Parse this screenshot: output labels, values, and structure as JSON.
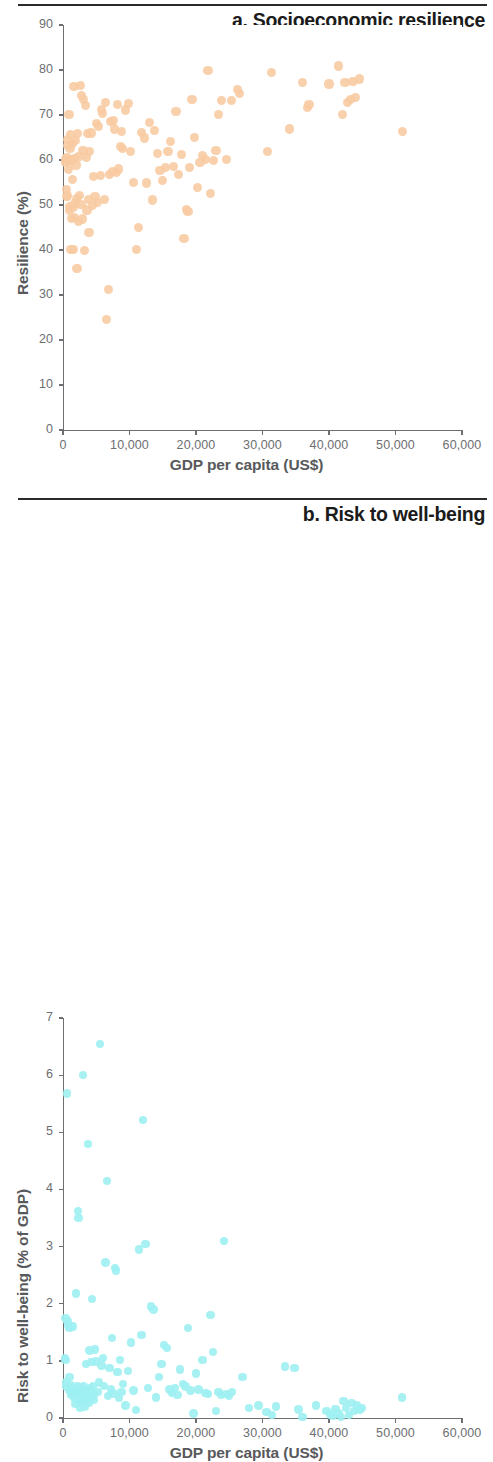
{
  "figure": {
    "panels": [
      {
        "id": "a",
        "title": "a. Socioeconomic resilience",
        "xlabel": "GDP per capita (US$)",
        "ylabel": "Resilience (%)",
        "point_color": "#f8c9a1",
        "xticks": [
          "0",
          "10,000",
          "20,000",
          "30,000",
          "40,000",
          "50,000",
          "60,000"
        ],
        "yticks": [
          "0",
          "10",
          "20",
          "30",
          "40",
          "50",
          "60",
          "70",
          "80",
          "90"
        ]
      },
      {
        "id": "b",
        "title": "b. Risk to well-being",
        "xlabel": "GDP per capita (US$)",
        "ylabel": "Risk to well-being (% of GDP)",
        "point_color": "#9df0f2",
        "xticks": [
          "0",
          "10,000",
          "20,000",
          "30,000",
          "40,000",
          "50,000",
          "60,000"
        ],
        "yticks": [
          "0",
          "1",
          "2",
          "3",
          "4",
          "5",
          "6",
          "7"
        ]
      }
    ]
  },
  "chart_data": [
    {
      "type": "scatter",
      "title": "a. Socioeconomic resilience",
      "xlabel": "GDP per capita (US$)",
      "ylabel": "Resilience (%)",
      "xlim": [
        0,
        60000
      ],
      "ylim": [
        0,
        90
      ],
      "xticks": [
        0,
        10000,
        20000,
        30000,
        40000,
        50000,
        60000
      ],
      "yticks": [
        0,
        10,
        20,
        30,
        40,
        50,
        60,
        70,
        80,
        90
      ],
      "grid": false,
      "legend": "none",
      "marker_color": "#f8c9a1",
      "points": [
        [
          400,
          60.2
        ],
        [
          450,
          59.4
        ],
        [
          500,
          53.4
        ],
        [
          550,
          51.8
        ],
        [
          600,
          60.6
        ],
        [
          650,
          52.0
        ],
        [
          700,
          64.5
        ],
        [
          750,
          63.3
        ],
        [
          800,
          59.8
        ],
        [
          850,
          57.9
        ],
        [
          900,
          70.1
        ],
        [
          950,
          48.8
        ],
        [
          1000,
          49.6
        ],
        [
          1050,
          62.5
        ],
        [
          1100,
          65.6
        ],
        [
          1200,
          40.2
        ],
        [
          1250,
          59.9
        ],
        [
          1300,
          47.0
        ],
        [
          1400,
          63.6
        ],
        [
          1450,
          55.6
        ],
        [
          1500,
          49.4
        ],
        [
          1600,
          40.1
        ],
        [
          1650,
          76.3
        ],
        [
          1700,
          60.3
        ],
        [
          1750,
          47.2
        ],
        [
          1800,
          50.4
        ],
        [
          1900,
          64.3
        ],
        [
          1950,
          58.9
        ],
        [
          2000,
          51.4
        ],
        [
          2100,
          35.8
        ],
        [
          2200,
          65.9
        ],
        [
          2300,
          46.3
        ],
        [
          2400,
          60.7
        ],
        [
          2500,
          52.2
        ],
        [
          2600,
          76.6
        ],
        [
          2700,
          50.1
        ],
        [
          2800,
          74.3
        ],
        [
          2900,
          46.9
        ],
        [
          3000,
          62.1
        ],
        [
          3100,
          73.5
        ],
        [
          3200,
          39.8
        ],
        [
          3400,
          72.2
        ],
        [
          3500,
          60.5
        ],
        [
          3600,
          48.9
        ],
        [
          3700,
          65.9
        ],
        [
          3800,
          51.3
        ],
        [
          3900,
          43.9
        ],
        [
          4000,
          61.8
        ],
        [
          4200,
          66.0
        ],
        [
          4400,
          49.9
        ],
        [
          4600,
          56.3
        ],
        [
          4800,
          51.9
        ],
        [
          5000,
          68.1
        ],
        [
          5200,
          50.6
        ],
        [
          5400,
          67.4
        ],
        [
          5600,
          56.5
        ],
        [
          5800,
          71.2
        ],
        [
          6000,
          70.4
        ],
        [
          6200,
          51.2
        ],
        [
          6400,
          72.7
        ],
        [
          6600,
          24.5
        ],
        [
          6800,
          31.3
        ],
        [
          7000,
          56.8
        ],
        [
          7200,
          68.6
        ],
        [
          7400,
          57.4
        ],
        [
          7600,
          68.8
        ],
        [
          7800,
          66.9
        ],
        [
          8000,
          57.3
        ],
        [
          8200,
          72.4
        ],
        [
          8400,
          58.0
        ],
        [
          8600,
          63.0
        ],
        [
          8800,
          66.4
        ],
        [
          9000,
          62.5
        ],
        [
          9400,
          71.1
        ],
        [
          9800,
          72.5
        ],
        [
          10200,
          61.9
        ],
        [
          10600,
          55.0
        ],
        [
          11000,
          40.1
        ],
        [
          11400,
          45.0
        ],
        [
          11800,
          66.2
        ],
        [
          12200,
          64.9
        ],
        [
          12600,
          54.9
        ],
        [
          13000,
          68.4
        ],
        [
          13400,
          51.1
        ],
        [
          13800,
          66.5
        ],
        [
          14200,
          61.5
        ],
        [
          14600,
          57.7
        ],
        [
          15000,
          55.5
        ],
        [
          15400,
          58.3
        ],
        [
          15800,
          61.8
        ],
        [
          16200,
          64.2
        ],
        [
          16600,
          58.6
        ],
        [
          17000,
          70.8
        ],
        [
          17400,
          56.8
        ],
        [
          17800,
          61.3
        ],
        [
          18200,
          42.5
        ],
        [
          18600,
          49.0
        ],
        [
          18800,
          48.5
        ],
        [
          19000,
          58.4
        ],
        [
          19400,
          73.4
        ],
        [
          19800,
          65.0
        ],
        [
          20200,
          53.8
        ],
        [
          20600,
          59.5
        ],
        [
          21000,
          61.0
        ],
        [
          21400,
          60.2
        ],
        [
          21800,
          79.8
        ],
        [
          22200,
          52.5
        ],
        [
          22600,
          59.9
        ],
        [
          23000,
          62.2
        ],
        [
          23400,
          70.2
        ],
        [
          23800,
          73.2
        ],
        [
          24600,
          60.1
        ],
        [
          25400,
          73.2
        ],
        [
          26200,
          75.7
        ],
        [
          26600,
          74.8
        ],
        [
          30800,
          61.9
        ],
        [
          31400,
          79.4
        ],
        [
          34000,
          66.9
        ],
        [
          36000,
          77.3
        ],
        [
          36800,
          71.7
        ],
        [
          37000,
          72.4
        ],
        [
          40000,
          76.9
        ],
        [
          41400,
          80.9
        ],
        [
          42000,
          70.2
        ],
        [
          42400,
          77.3
        ],
        [
          42800,
          72.7
        ],
        [
          43200,
          73.4
        ],
        [
          43600,
          77.5
        ],
        [
          44000,
          73.8
        ],
        [
          44600,
          78.0
        ],
        [
          51000,
          66.4
        ]
      ]
    },
    {
      "type": "scatter",
      "title": "b. Risk to well-being",
      "xlabel": "GDP per capita (US$)",
      "ylabel": "Risk to well-being (% of GDP)",
      "xlim": [
        0,
        60000
      ],
      "ylim": [
        0,
        7
      ],
      "xticks": [
        0,
        10000,
        20000,
        30000,
        40000,
        50000,
        60000
      ],
      "yticks": [
        0,
        1,
        2,
        3,
        4,
        5,
        6,
        7
      ],
      "grid": false,
      "legend": "none",
      "marker_color": "#9df0f2",
      "points": [
        [
          300,
          1.05
        ],
        [
          350,
          1.75
        ],
        [
          400,
          1.02
        ],
        [
          450,
          0.62
        ],
        [
          500,
          0.55
        ],
        [
          600,
          5.68
        ],
        [
          700,
          1.7
        ],
        [
          800,
          1.62
        ],
        [
          900,
          0.5
        ],
        [
          950,
          0.72
        ],
        [
          1000,
          1.58
        ],
        [
          1100,
          0.45
        ],
        [
          1200,
          0.58
        ],
        [
          1300,
          0.4
        ],
        [
          1400,
          0.52
        ],
        [
          1500,
          1.6
        ],
        [
          1600,
          0.48
        ],
        [
          1700,
          0.35
        ],
        [
          1800,
          0.44
        ],
        [
          1900,
          0.25
        ],
        [
          2000,
          2.18
        ],
        [
          2100,
          0.42
        ],
        [
          2200,
          0.55
        ],
        [
          2300,
          3.62
        ],
        [
          2350,
          3.5
        ],
        [
          2400,
          0.3
        ],
        [
          2500,
          0.47
        ],
        [
          2600,
          0.18
        ],
        [
          2700,
          0.5
        ],
        [
          2800,
          0.38
        ],
        [
          2900,
          0.28
        ],
        [
          3000,
          6.0
        ],
        [
          3100,
          0.55
        ],
        [
          3200,
          0.44
        ],
        [
          3300,
          0.2
        ],
        [
          3400,
          0.33
        ],
        [
          3500,
          0.95
        ],
        [
          3600,
          0.48
        ],
        [
          3700,
          0.42
        ],
        [
          3800,
          4.8
        ],
        [
          3900,
          0.26
        ],
        [
          4000,
          1.18
        ],
        [
          4100,
          0.52
        ],
        [
          4200,
          0.36
        ],
        [
          4300,
          0.98
        ],
        [
          4400,
          2.08
        ],
        [
          4500,
          0.55
        ],
        [
          4600,
          0.4
        ],
        [
          4700,
          0.31
        ],
        [
          4800,
          1.2
        ],
        [
          5000,
          0.99
        ],
        [
          5200,
          0.45
        ],
        [
          5400,
          0.62
        ],
        [
          5600,
          6.55
        ],
        [
          5800,
          0.92
        ],
        [
          6000,
          1.05
        ],
        [
          6200,
          0.56
        ],
        [
          6400,
          2.72
        ],
        [
          6600,
          4.15
        ],
        [
          6800,
          0.38
        ],
        [
          7000,
          0.88
        ],
        [
          7200,
          0.5
        ],
        [
          7400,
          1.4
        ],
        [
          7600,
          0.43
        ],
        [
          7800,
          2.62
        ],
        [
          8000,
          2.58
        ],
        [
          8200,
          0.8
        ],
        [
          8400,
          0.35
        ],
        [
          8600,
          1.02
        ],
        [
          8800,
          0.46
        ],
        [
          9000,
          0.6
        ],
        [
          9400,
          0.22
        ],
        [
          9800,
          0.82
        ],
        [
          10200,
          1.32
        ],
        [
          10600,
          0.48
        ],
        [
          11000,
          0.14
        ],
        [
          11400,
          2.95
        ],
        [
          11800,
          1.45
        ],
        [
          12000,
          5.22
        ],
        [
          12400,
          3.05
        ],
        [
          12800,
          0.52
        ],
        [
          13200,
          1.95
        ],
        [
          13600,
          1.9
        ],
        [
          14000,
          0.36
        ],
        [
          14400,
          0.72
        ],
        [
          14800,
          0.94
        ],
        [
          15200,
          1.28
        ],
        [
          15600,
          1.22
        ],
        [
          16000,
          0.5
        ],
        [
          16400,
          0.44
        ],
        [
          16800,
          0.52
        ],
        [
          17200,
          0.4
        ],
        [
          17600,
          0.85
        ],
        [
          18000,
          0.6
        ],
        [
          18400,
          0.55
        ],
        [
          18800,
          1.58
        ],
        [
          19200,
          0.48
        ],
        [
          19600,
          0.08
        ],
        [
          20000,
          0.78
        ],
        [
          20400,
          0.5
        ],
        [
          21000,
          1.02
        ],
        [
          21400,
          0.44
        ],
        [
          21800,
          0.42
        ],
        [
          22200,
          1.8
        ],
        [
          22600,
          1.15
        ],
        [
          23000,
          0.12
        ],
        [
          23400,
          0.45
        ],
        [
          23800,
          0.4
        ],
        [
          24200,
          3.1
        ],
        [
          24600,
          0.42
        ],
        [
          25000,
          0.38
        ],
        [
          25400,
          0.46
        ],
        [
          27000,
          0.72
        ],
        [
          28000,
          0.18
        ],
        [
          29400,
          0.22
        ],
        [
          30600,
          0.1
        ],
        [
          31400,
          0.05
        ],
        [
          32000,
          0.2
        ],
        [
          33400,
          0.9
        ],
        [
          34800,
          0.88
        ],
        [
          35400,
          0.15
        ],
        [
          36000,
          0.02
        ],
        [
          38000,
          0.22
        ],
        [
          39600,
          0.12
        ],
        [
          40200,
          0.06
        ],
        [
          40600,
          0.04
        ],
        [
          41000,
          0.16
        ],
        [
          41400,
          0.08
        ],
        [
          41800,
          0.02
        ],
        [
          42200,
          0.3
        ],
        [
          42600,
          0.18
        ],
        [
          43000,
          0.05
        ],
        [
          43400,
          0.26
        ],
        [
          43800,
          0.12
        ],
        [
          44200,
          0.22
        ],
        [
          44600,
          0.14
        ],
        [
          45000,
          0.18
        ],
        [
          51000,
          0.36
        ]
      ]
    }
  ]
}
